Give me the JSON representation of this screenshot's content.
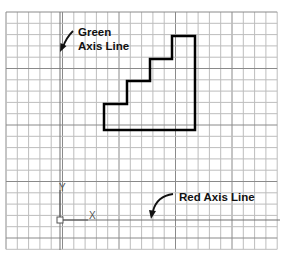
{
  "diagram": {
    "labels": {
      "green_axis_line1": "Green",
      "green_axis_line2": "Axis Line",
      "red_axis": "Red Axis Line",
      "y_axis_letter": "Y",
      "x_axis_letter": "X"
    },
    "grid": {
      "origin_x": 6,
      "origin_y": 12,
      "spacing": 11.3,
      "cols": 24,
      "rows": 21,
      "line_color": "#bdbdbd",
      "major_line_color": "#8a8a8a"
    },
    "ucs_origin": {
      "x": 60,
      "y": 220
    },
    "staircase_points": [
      [
        104,
        130
      ],
      [
        104,
        104
      ],
      [
        127,
        104
      ],
      [
        127,
        81
      ],
      [
        150,
        81
      ],
      [
        150,
        59
      ],
      [
        172,
        59
      ],
      [
        172,
        36
      ],
      [
        195,
        36
      ],
      [
        195,
        130
      ]
    ],
    "staircase_color": "#000000"
  }
}
